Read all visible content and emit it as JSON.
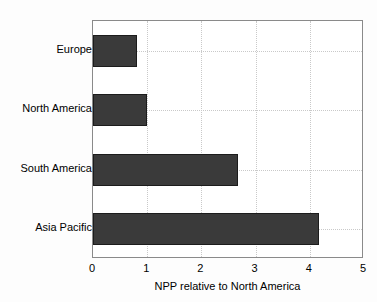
{
  "chart_data": {
    "type": "bar",
    "orientation": "horizontal",
    "title": "",
    "xlabel": "NPP relative to North America",
    "ylabel": "",
    "categories": [
      "Europe",
      "North America",
      "South America",
      "Asia Pacific"
    ],
    "values": [
      0.81,
      1.0,
      2.68,
      4.17
    ],
    "xlim": [
      0,
      5
    ],
    "xticks": [
      0,
      1,
      2,
      3,
      4,
      5
    ],
    "xtick_labels": [
      "0",
      "1",
      "2",
      "3",
      "4",
      "5"
    ],
    "grid": true,
    "grid_style": "dotted",
    "legend": null,
    "colors": {
      "bar_fill": "#3a3a3a",
      "bar_edge": "#1c1c1c",
      "grid": "#c9c9c9",
      "axis": "#8a8a8a",
      "plot_background": "#ffffff",
      "figure_background": "#fdfdfd",
      "text": "#000000"
    }
  }
}
